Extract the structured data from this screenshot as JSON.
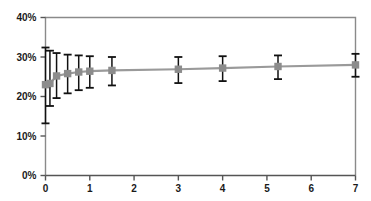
{
  "chart_data": {
    "type": "line",
    "title": "",
    "subtitle": "",
    "xlabel": "",
    "ylabel": "",
    "xlim": [
      0,
      7
    ],
    "ylim": [
      0,
      40
    ],
    "grid": false,
    "legend": null,
    "legend_position": "none",
    "x_tick_labels": [
      "0",
      "1",
      "2",
      "3",
      "4",
      "5",
      "6",
      "7"
    ],
    "x_tick_values": [
      0,
      1,
      2,
      3,
      4,
      5,
      6,
      7
    ],
    "y_tick_labels": [
      "0%",
      "10%",
      "20%",
      "30%",
      "40%"
    ],
    "y_tick_values": [
      0,
      10,
      20,
      30,
      40
    ],
    "y_unit": "%",
    "marker_color": "#8c8c8c",
    "line_color": "#9a9a9a",
    "errorbar_color": "#111111",
    "axis_color": "#8a8a8a",
    "series": [
      {
        "name": "estimate",
        "x": [
          0,
          0.1,
          0.25,
          0.5,
          0.75,
          1.0,
          1.5,
          3.0,
          4.0,
          5.25,
          7.0
        ],
        "values": [
          23.0,
          23.3,
          25.2,
          25.8,
          26.2,
          26.4,
          26.6,
          26.9,
          27.2,
          27.6,
          28.0
        ],
        "err_low": [
          13.2,
          17.6,
          19.6,
          20.8,
          21.6,
          22.2,
          22.8,
          23.4,
          23.9,
          24.4,
          25.0
        ],
        "err_high": [
          32.4,
          31.6,
          31.0,
          30.6,
          30.4,
          30.2,
          30.0,
          30.0,
          30.2,
          30.4,
          30.8
        ]
      }
    ]
  }
}
